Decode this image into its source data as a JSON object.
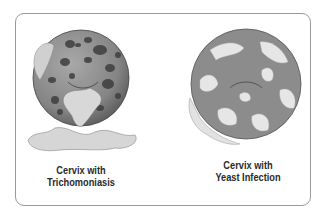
{
  "figure": {
    "left": {
      "caption_line1": "Cervix with",
      "caption_line2": "Trichomoniasis"
    },
    "right": {
      "caption_line1": "Cervix with",
      "caption_line2": "Yeast Infection"
    }
  },
  "colors": {
    "sphere": "#8a8a8a",
    "spots": "#3e3e3e",
    "discharge": "#d4d4d4",
    "frame": "#9a9a9a"
  }
}
